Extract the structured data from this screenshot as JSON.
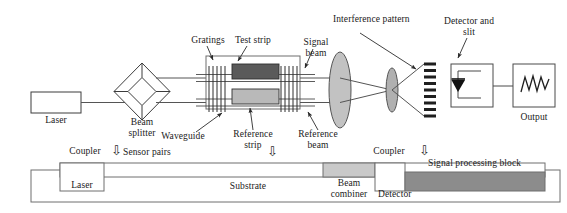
{
  "figure": {
    "colors": {
      "line": "#3c3c3c",
      "test_strip_fill": "#5a5a5a",
      "reference_strip_fill": "#b9b9b9",
      "lens_fill": "#c2c2c2",
      "beam_combiner_fill": "#c9c9c9",
      "signal_block_fill": "#8c8c8c",
      "text": "#1a1a1a"
    }
  },
  "top_diagram": {
    "laser_box": {
      "label": "Laser"
    },
    "beam_splitter": {
      "label_line1": "Beam",
      "label_line2": "splitter"
    },
    "gratings": {
      "label": "Gratings"
    },
    "test_strip": {
      "label": "Test strip"
    },
    "waveguide": {
      "label": "Waveguide"
    },
    "reference_strip": {
      "label_line1": "Reference",
      "label_line2": "strip"
    },
    "signal_beam": {
      "label_line1": "Signal",
      "label_line2": "beam"
    },
    "reference_beam": {
      "label_line1": "Reference",
      "label_line2": "beam"
    },
    "interference_pattern": {
      "label": "Interference pattern"
    },
    "detector_and_slit": {
      "label_line1": "Detector and",
      "label_line2": "slit"
    },
    "output_box": {
      "label": "Output"
    },
    "sensor_pairs": {
      "label": "Sensor pairs"
    }
  },
  "bottom_diagram": {
    "coupler_left": {
      "label": "Coupler"
    },
    "coupler_right": {
      "label": "Coupler"
    },
    "laser_block": {
      "label": "Laser"
    },
    "substrate": {
      "label": "Substrate"
    },
    "beam_combiner": {
      "label_line1": "Beam",
      "label_line2": "combiner"
    },
    "detector_block": {
      "label": "Detector"
    },
    "signal_processing_block": {
      "label": "Signal processing block"
    }
  },
  "glyphs": {
    "down_arrow": "⇩"
  }
}
